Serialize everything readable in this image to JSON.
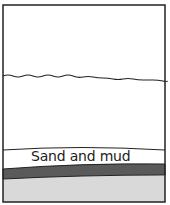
{
  "diagram": {
    "layers": [
      {
        "name": "water",
        "color": "#ffffff"
      },
      {
        "name": "sand-and-mud",
        "label": "Sand and mud",
        "color": "#ffffff"
      },
      {
        "name": "dark-layer",
        "color": "#5a5a5a"
      },
      {
        "name": "bottom-layer",
        "color": "#d9d9d9"
      }
    ],
    "sand_label": "Sand and mud"
  }
}
